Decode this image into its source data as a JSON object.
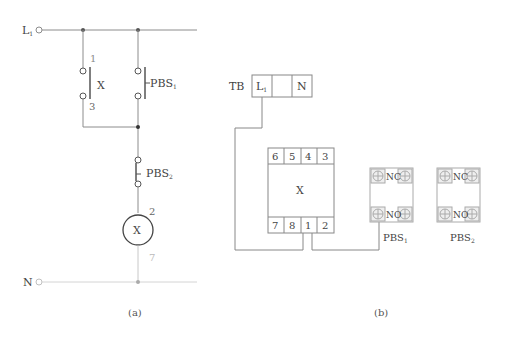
{
  "colors": {
    "line": "#8c8c8c",
    "dark": "#555555",
    "light": "#c8c8c8",
    "text": "#444444",
    "label_gray": "#8a8a8a",
    "box_fill": "#f4f4f4"
  },
  "panel_a": {
    "caption": "(a)",
    "supply_top": {
      "label": "L",
      "sub": "1"
    },
    "supply_bottom": {
      "label": "N"
    },
    "contact_x": {
      "name": "X",
      "top_terminal": "1",
      "bottom_terminal": "3"
    },
    "pbs1": {
      "label": "PBS",
      "sub": "1"
    },
    "pbs2": {
      "label": "PBS",
      "sub": "2"
    },
    "coil": {
      "name": "X",
      "top_terminal": "2",
      "bottom_terminal": "7"
    }
  },
  "panel_b": {
    "caption": "(b)",
    "terminal_block": {
      "label": "TB",
      "cells": [
        {
          "label": "L",
          "sub": "1"
        },
        {
          "label": ""
        },
        {
          "label": "N"
        }
      ]
    },
    "relay": {
      "name": "X",
      "top_pins": [
        "6",
        "5",
        "4",
        "3"
      ],
      "bottom_pins": [
        "7",
        "8",
        "1",
        "2"
      ]
    },
    "pushbuttons": [
      {
        "label": "PBS",
        "sub": "1",
        "top": "NC",
        "bottom": "NO"
      },
      {
        "label": "PBS",
        "sub": "2",
        "top": "NC",
        "bottom": "NO"
      }
    ]
  }
}
